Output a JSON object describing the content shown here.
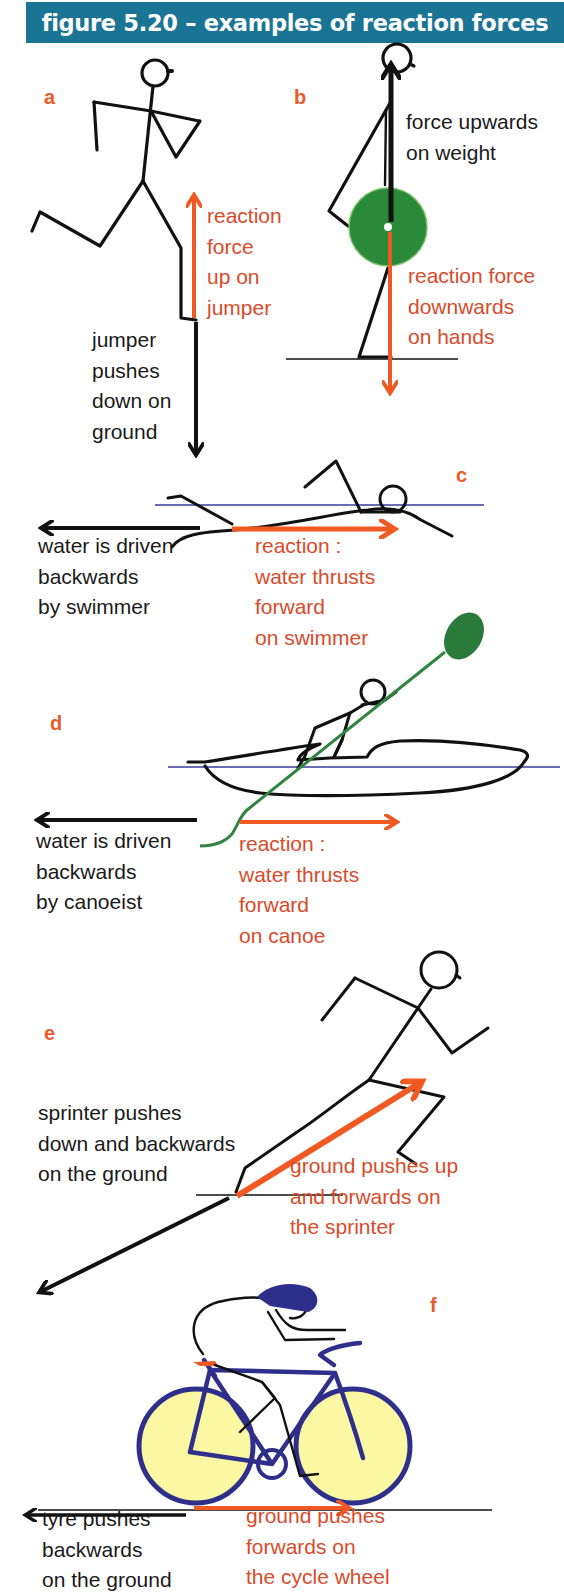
{
  "header": {
    "title": "figure 5.20 – examples of reaction forces"
  },
  "colors": {
    "header_bg": "#1a7595",
    "reaction_arrow": "#f05a22",
    "reaction_text": "#d94b2b",
    "action_arrow": "#111111",
    "weight_disc": "#2a8a3a",
    "paddle": "#2f8540",
    "water_line": "#3a3a9a",
    "cycle_frame": "#2e2f8a",
    "cycle_wheel_fill": "#fbf7a3"
  },
  "panels": {
    "a": {
      "letter": "a",
      "reaction_label": [
        "reaction",
        "force",
        "up on",
        "jumper"
      ],
      "action_label": [
        "jumper",
        "pushes",
        "down on",
        "ground"
      ]
    },
    "b": {
      "letter": "b",
      "action_label": [
        "force upwards",
        "on weight"
      ],
      "reaction_label": [
        "reaction force",
        "downwards",
        "on hands"
      ]
    },
    "c": {
      "letter": "c",
      "action_label": [
        "water is driven",
        "backwards",
        "by swimmer"
      ],
      "reaction_label": [
        "reaction :",
        "water thrusts",
        "forward",
        "on swimmer"
      ]
    },
    "d": {
      "letter": "d",
      "action_label": [
        "water is driven",
        "backwards",
        "by canoeist"
      ],
      "reaction_label": [
        "reaction :",
        "water thrusts",
        "forward",
        "on canoe"
      ]
    },
    "e": {
      "letter": "e",
      "action_label": [
        "sprinter pushes",
        "down and backwards",
        "on the ground"
      ],
      "reaction_label": [
        "ground pushes up",
        "and forwards on",
        "the sprinter"
      ]
    },
    "f": {
      "letter": "f",
      "action_label": [
        "tyre pushes",
        "backwards",
        "on the ground"
      ],
      "reaction_label": [
        "ground pushes",
        "forwards on",
        "the cycle wheel"
      ]
    }
  }
}
